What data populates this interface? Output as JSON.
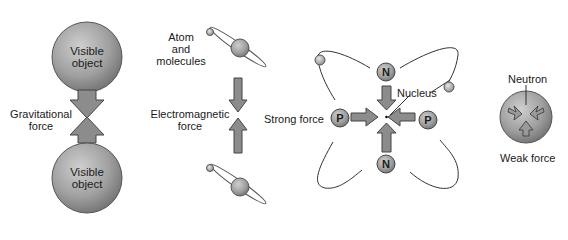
{
  "gravity": {
    "top_object_label": "Visible\nobject",
    "top_line1": "Visible",
    "top_line2": "object",
    "bottom_line1": "Visible",
    "bottom_line2": "object",
    "force_line1": "Gravitational",
    "force_line2": "force"
  },
  "electromagnetic": {
    "atom_line1": "Atom",
    "atom_line2": "and",
    "atom_line3": "molecules",
    "force_line1": "Electromagnetic",
    "force_line2": "force"
  },
  "strong": {
    "force_label": "Strong force",
    "nucleus_label": "Nucleus",
    "top_particle": "N",
    "bottom_particle": "N",
    "left_particle": "P",
    "right_particle": "P"
  },
  "weak": {
    "neutron_label": "Neutron",
    "force_label": "Weak force"
  },
  "colors": {
    "sphere_fill": "#9a9a9a",
    "arrow_fill": "#8c8c8c",
    "outline": "#444444"
  }
}
